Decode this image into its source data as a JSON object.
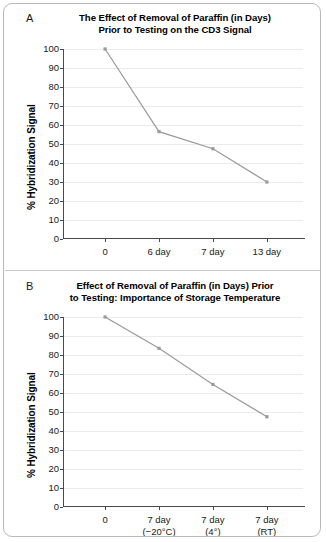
{
  "figure": {
    "panel_a_letter": "A",
    "panel_b_letter": "B"
  },
  "chart_data": [
    {
      "id": "panel-a",
      "type": "line",
      "title": "The Effect of Removal of Paraffin (in Days)\nPrior to Testing on the CD3 Signal",
      "title_line1": "The Effect of Removal of Paraffin (in Days)",
      "title_line2": "Prior to Testing on the CD3 Signal",
      "xlabel": "",
      "ylabel": "% Hybridization Signal",
      "categories": [
        "0",
        "6 day",
        "7 day",
        "13 day"
      ],
      "category_lines": [
        [
          "0",
          ""
        ],
        [
          "6 day",
          ""
        ],
        [
          "7 day",
          ""
        ],
        [
          "13 day",
          ""
        ]
      ],
      "values": [
        100,
        56.5,
        47.5,
        30
      ],
      "ylim": [
        0,
        100
      ],
      "yticks": [
        0,
        10,
        20,
        30,
        40,
        50,
        60,
        70,
        80,
        90,
        100
      ],
      "ytick_labels": [
        "0",
        "10",
        "20",
        "30",
        "40",
        "50",
        "60",
        "70",
        "80",
        "90",
        "100"
      ],
      "grid": true,
      "legend": false,
      "series_color": "#9a9a9a",
      "marker": "square"
    },
    {
      "id": "panel-b",
      "type": "line",
      "title": "Effect of Removal of Paraffin (in Days) Prior\nto Testing: Importance of Storage Temperature",
      "title_line1": "Effect of Removal of Paraffin (in Days) Prior",
      "title_line2": "to Testing: Importance of Storage Temperature",
      "xlabel": "",
      "ylabel": "% Hybridization Signal",
      "categories": [
        "0",
        "7 day (−20°C)",
        "7 day (4°)",
        "7 day (RT)"
      ],
      "category_lines": [
        [
          "0",
          ""
        ],
        [
          "7 day",
          "(−20°C)"
        ],
        [
          "7 day",
          "(4°)"
        ],
        [
          "7 day",
          "(RT)"
        ]
      ],
      "values": [
        100,
        83.5,
        64.5,
        47.5
      ],
      "ylim": [
        0,
        100
      ],
      "yticks": [
        0,
        10,
        20,
        30,
        40,
        50,
        60,
        70,
        80,
        90,
        100
      ],
      "ytick_labels": [
        "0",
        "10",
        "20",
        "30",
        "40",
        "50",
        "60",
        "70",
        "80",
        "90",
        "100"
      ],
      "grid": true,
      "legend": false,
      "series_color": "#9a9a9a",
      "marker": "square"
    }
  ],
  "colors": {
    "grid": "#ebebeb",
    "axis": "#4a4a4a",
    "series": "#9a9a9a",
    "frame": "#b9b9b9",
    "text": "#1a1a1a"
  }
}
